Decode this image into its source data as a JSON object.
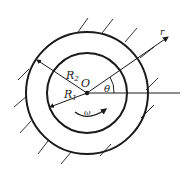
{
  "diagram": {
    "labels": {
      "outer_radius": "R",
      "outer_radius_sub": "2",
      "inner_radius": "R",
      "inner_radius_sub": "1",
      "center": "O",
      "angle": "θ",
      "radial_axis": "r",
      "angular_velocity": "ω"
    },
    "colors": {
      "stroke": "#1a1a1a",
      "background": "#ffffff"
    }
  }
}
